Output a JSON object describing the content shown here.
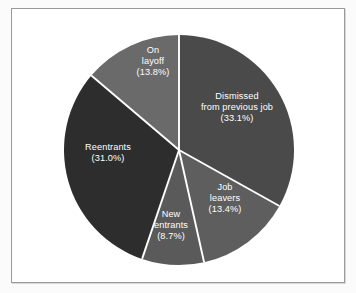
{
  "chart_data": {
    "type": "pie",
    "title": "",
    "subtitle": "",
    "xlabel": "",
    "ylabel": "",
    "legend_position": "none",
    "grid": false,
    "labels_inside_slices": true,
    "start_angle_deg": 0,
    "direction": "clockwise",
    "categories": [
      "Dismissed from previous job",
      "Job leavers",
      "New entrants",
      "Reentrants",
      "On layoff"
    ],
    "values": [
      33.1,
      13.4,
      8.7,
      31.0,
      13.8
    ],
    "value_unit": "percent",
    "slices": [
      {
        "name": "dismissed-from-previous-job",
        "label_lines": [
          "Dismissed",
          "from previous job",
          "(33.1%)"
        ],
        "value": 33.1,
        "percent_text": "(33.1%)",
        "color": "#4a4a4a",
        "start_deg": 0.0,
        "end_deg": 119.16,
        "label_x": 237,
        "label_y": 108
      },
      {
        "name": "job-leavers",
        "label_lines": [
          "Job",
          "leavers",
          "(13.4%)"
        ],
        "value": 13.4,
        "percent_text": "(13.4%)",
        "color": "#5e5e5e",
        "start_deg": 119.16,
        "end_deg": 167.4,
        "label_x": 225,
        "label_y": 199
      },
      {
        "name": "new-entrants",
        "label_lines": [
          "New",
          "entrants",
          "(8.7%)"
        ],
        "value": 8.7,
        "percent_text": "(8.7%)",
        "color": "#5a5a5a",
        "start_deg": 167.4,
        "end_deg": 198.72,
        "label_x": 171,
        "label_y": 226
      },
      {
        "name": "reentrants",
        "label_lines": [
          "Reentrants",
          "(31.0%)"
        ],
        "value": 31.0,
        "percent_text": "(31.0%)",
        "color": "#2d2d2d",
        "start_deg": 198.72,
        "end_deg": 310.32,
        "label_x": 108,
        "label_y": 153
      },
      {
        "name": "on-layoff",
        "label_lines": [
          "On",
          "layoff",
          "(13.8%)"
        ],
        "value": 13.8,
        "percent_text": "(13.8%)",
        "color": "#6a6a6a",
        "start_deg": 310.32,
        "end_deg": 360.0,
        "label_x": 153,
        "label_y": 62
      }
    ],
    "geometry": {
      "center_x": 179,
      "center_y": 150,
      "radius": 115
    },
    "colors": {
      "separator": "#ffffff",
      "label_text": "#ffffff",
      "frame_border": "#9a9a9a",
      "page_background": "#fbfbfb",
      "plot_background": "#ffffff"
    }
  }
}
